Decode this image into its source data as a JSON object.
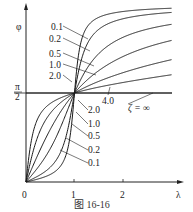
{
  "chart_data": {
    "type": "line",
    "title": "",
    "caption": "图 16-16",
    "xlabel": "λ",
    "ylabel": "φ",
    "x_ticks": [
      "0",
      "1",
      "2"
    ],
    "y_ticks": [
      "π/2"
    ],
    "xlim": [
      0,
      3
    ],
    "ylim": [
      0,
      3.14159
    ],
    "grid": false,
    "legend": "inline labels",
    "annotation": "ζ = ∞",
    "series": [
      {
        "name": "0.1",
        "zeta": 0.1
      },
      {
        "name": "0.2",
        "zeta": 0.2
      },
      {
        "name": "0.5",
        "zeta": 0.5
      },
      {
        "name": "1.0",
        "zeta": 1.0
      },
      {
        "name": "2.0",
        "zeta": 2.0
      },
      {
        "name": "4.0",
        "zeta": 4.0
      },
      {
        "name": "∞",
        "zeta": "infinity"
      }
    ],
    "formula": "φ = atan2(2ζλ, 1 − λ²)"
  },
  "labels": {
    "y_axis": "φ",
    "x_axis": "λ",
    "origin": "0",
    "tick_1": "1",
    "tick_2": "2",
    "pi_num": "π",
    "pi_den": "2",
    "zeta_inf": "ζ = ∞",
    "caption": "图    16-16",
    "upper": [
      "0.1",
      "0.2",
      "0.5",
      "1.0",
      "2.0"
    ],
    "upper_4": "4.0",
    "lower": [
      "2.0",
      "1.0",
      "0.5",
      "0.2",
      "0.1"
    ]
  }
}
